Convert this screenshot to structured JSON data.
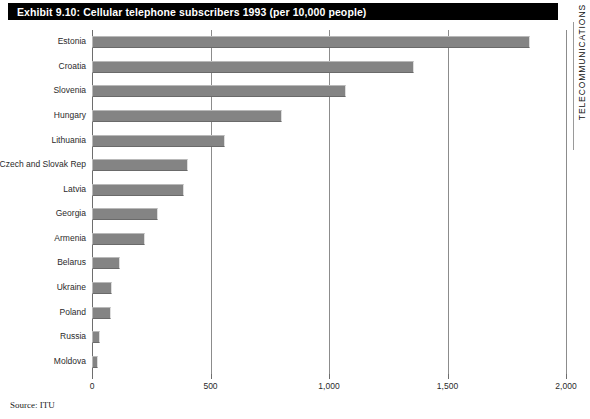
{
  "title": "Exhibit 9.10: Cellular telephone subscribers 1993 (per 10,000 people)",
  "side_running_head": "TELECOMMUNICATIONS",
  "source_note": "Source: ITU",
  "colors": {
    "title_background": "#000000",
    "title_text": "#ffffff",
    "bar_fill": "#848484",
    "bar_highlight": "#b9b9b9",
    "bar_shadow": "#6a6a6a",
    "gridline": "#8c8c8c",
    "axis": "#6e6e6e",
    "page_background": "#ffffff"
  },
  "chart_data": {
    "type": "bar",
    "orientation": "horizontal",
    "title": "Exhibit 9.10: Cellular telephone subscribers 1993 (per 10,000 people)",
    "xlabel": "",
    "ylabel": "",
    "xlim": [
      0,
      2000
    ],
    "ticks": [
      "0",
      "500",
      "1,000",
      "1,500",
      "2,000"
    ],
    "tick_values": [
      0,
      500,
      1000,
      1500,
      2000
    ],
    "grid": true,
    "grid_axis": "x",
    "legend": false,
    "categories": [
      "Estonia",
      "Croatia",
      "Slovenia",
      "Hungary",
      "Lithuania",
      "Czech and Slovak Rep",
      "Latvia",
      "Georgia",
      "Armenia",
      "Belarus",
      "Ukraine",
      "Poland",
      "Russia",
      "Moldova"
    ],
    "values": [
      1850,
      1360,
      1070,
      800,
      560,
      405,
      390,
      280,
      225,
      120,
      85,
      80,
      35,
      25
    ]
  }
}
